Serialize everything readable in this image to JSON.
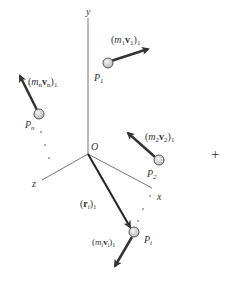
{
  "diagram": {
    "axes": {
      "x_label": "x",
      "y_label": "y",
      "z_label": "z",
      "origin_label": "O"
    },
    "particles": [
      {
        "id": "P1",
        "label": "P",
        "subscript": "1",
        "momentum_label": {
          "m": "m",
          "msub": "1",
          "v": "v",
          "vsub": "1",
          "outer": "1"
        }
      },
      {
        "id": "P2",
        "label": "P",
        "subscript": "2",
        "momentum_label": {
          "m": "m",
          "msub": "2",
          "v": "v",
          "vsub": "2",
          "outer": "1"
        }
      },
      {
        "id": "Pn",
        "label": "P",
        "subscript": "n",
        "momentum_label": {
          "m": "m",
          "msub": "n",
          "v": "v",
          "vsub": "n",
          "outer": "1"
        }
      },
      {
        "id": "Pi",
        "label": "P",
        "subscript": "i",
        "momentum_label": {
          "m": "m",
          "msub": "i",
          "v": "v",
          "vsub": "i",
          "outer": "1"
        }
      }
    ],
    "position_vector": {
      "symbol": "r",
      "sub": "i",
      "outer": "1"
    },
    "plus_sign": "+",
    "colors": {
      "axis": "#777777",
      "arrow": "#333333",
      "particle_fill": "#d8d8d8",
      "particle_stroke": "#555555",
      "text": "#333333"
    }
  }
}
